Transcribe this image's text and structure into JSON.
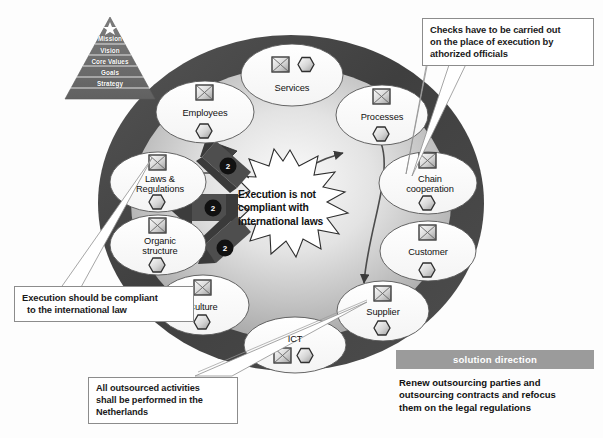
{
  "diagram": {
    "colors": {
      "ring_dark": "#4a4a4a",
      "ring_mid": "#6e6e6e",
      "inner_light": "#f2f2f2",
      "inner_shade": "#b9b9b9",
      "node_fill": "#ffffff",
      "node_stroke": "#555555",
      "arrow_dark": "#3c3c3c",
      "callout_border": "#8c8c8c",
      "panel_header_bg": "#9b9b9b",
      "text": "#111111"
    }
  },
  "pyramid": {
    "name": "strategy-pyramid",
    "apex_icon": "star-icon",
    "tiers": [
      {
        "label": "Mission"
      },
      {
        "label": "Vision"
      },
      {
        "label": "Core Values"
      },
      {
        "label": "Goals"
      },
      {
        "label": "Strategy"
      }
    ]
  },
  "nodes": [
    {
      "id": "services",
      "label": "Services",
      "icons": [
        "square-icon",
        "hexagon-icon"
      ],
      "icon_layout": "row"
    },
    {
      "id": "employees",
      "label": "Employees",
      "icons": [
        "square-icon",
        "hexagon-icon"
      ],
      "icon_layout": "stack"
    },
    {
      "id": "processes",
      "label": "Processes",
      "icons": [
        "square-icon",
        "hexagon-icon"
      ],
      "icon_layout": "stack"
    },
    {
      "id": "chain-cooperation",
      "label": "Chain\ncooperation",
      "icons": [
        "square-icon",
        "hexagon-icon"
      ],
      "icon_layout": "stack"
    },
    {
      "id": "customer",
      "label": "Customer",
      "icons": [
        "square-icon",
        "hexagon-icon"
      ],
      "icon_layout": "stack"
    },
    {
      "id": "supplier",
      "label": "Supplier",
      "icons": [
        "square-icon",
        "hexagon-icon"
      ],
      "icon_layout": "stack"
    },
    {
      "id": "ict",
      "label": "ICT",
      "icons": [
        "square-icon",
        "hexagon-icon"
      ],
      "icon_layout": "row"
    },
    {
      "id": "culture",
      "label": "Culture",
      "icons": [
        "square-icon",
        "hexagon-icon"
      ],
      "icon_layout": "stack"
    },
    {
      "id": "organic-structure",
      "label": "Organic\nstructure",
      "icons": [
        "square-icon",
        "hexagon-icon"
      ],
      "icon_layout": "stack"
    },
    {
      "id": "laws-regulations",
      "label": "Laws &\nRegulations",
      "icons": [
        "square-icon",
        "hexagon-icon"
      ],
      "icon_layout": "stack"
    }
  ],
  "burst": {
    "name": "central-burst",
    "line1": "Execution is not",
    "line2": "compliant with",
    "line3": "international laws"
  },
  "impact_arrows": [
    {
      "target": "laws-regulations",
      "badge": "2"
    },
    {
      "target": "organic-structure",
      "badge": "2"
    },
    {
      "target": "culture",
      "badge": "2"
    }
  ],
  "callouts": [
    {
      "id": "checks",
      "lines": [
        "Checks have to be carried out",
        "on the place of execution by",
        "athorized officials"
      ]
    },
    {
      "id": "compliant",
      "lines": [
        "Execution should be compliant",
        "to the international law"
      ]
    },
    {
      "id": "outsourced",
      "lines": [
        "All outsourced activities",
        "shall be performed in the",
        "Netherlands"
      ]
    }
  ],
  "solution": {
    "header": "solution direction",
    "line1": "Renew outsourcing parties and",
    "line2": "outsourcing contracts and refocus",
    "line3": "them on the legal regulations"
  }
}
